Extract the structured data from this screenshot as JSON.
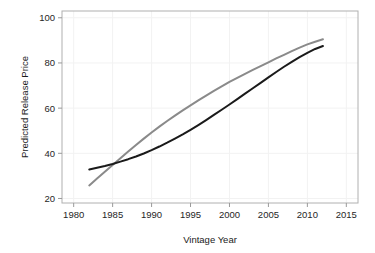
{
  "chart_data": {
    "type": "line",
    "title": "",
    "subtitle": "",
    "xlabel": "Vintage Year",
    "ylabel": "Predicted Release Price",
    "xlim": [
      1978.5,
      2016.5
    ],
    "ylim": [
      18.0,
      103.0
    ],
    "xticks": [
      1980,
      1985,
      1990,
      1995,
      2000,
      2005,
      2010,
      2015
    ],
    "xtick_labels": [
      "1980",
      "1985",
      "1990",
      "1995",
      "2000",
      "2005",
      "2010",
      "2015"
    ],
    "yticks": [
      20,
      40,
      60,
      80,
      100
    ],
    "ytick_labels": [
      "20",
      "40",
      "60",
      "80",
      "100"
    ],
    "grid": "faint",
    "legend": "none",
    "series": [
      {
        "name": "gray-curve",
        "color": "#8a8a8a",
        "linewidth": 2.0,
        "x": [
          1982,
          1983,
          1984,
          1985,
          1986,
          1987,
          1988,
          1989,
          1990,
          1991,
          1992,
          1993,
          1994,
          1995,
          1996,
          1997,
          1998,
          1999,
          2000,
          2001,
          2002,
          2003,
          2004,
          2005,
          2006,
          2007,
          2008,
          2009,
          2010,
          2011,
          2012
        ],
        "values": [
          25.8,
          28.8,
          31.8,
          34.8,
          37.8,
          40.8,
          43.7,
          46.5,
          49.2,
          51.8,
          54.3,
          56.7,
          59.0,
          61.2,
          63.4,
          65.5,
          67.6,
          69.6,
          71.6,
          73.4,
          75.2,
          76.9,
          78.6,
          80.3,
          82.0,
          83.6,
          85.2,
          86.8,
          88.2,
          89.4,
          90.5
        ]
      },
      {
        "name": "black-curve",
        "color": "#1a1a1a",
        "linewidth": 2.0,
        "x": [
          1982,
          1983,
          1984,
          1985,
          1986,
          1987,
          1988,
          1989,
          1990,
          1991,
          1992,
          1993,
          1994,
          1995,
          1996,
          1997,
          1998,
          1999,
          2000,
          2001,
          2002,
          2003,
          2004,
          2005,
          2006,
          2007,
          2008,
          2009,
          2010,
          2011,
          2012
        ],
        "values": [
          32.8,
          33.6,
          34.4,
          35.3,
          36.3,
          37.4,
          38.6,
          39.9,
          41.4,
          43.0,
          44.7,
          46.5,
          48.4,
          50.4,
          52.5,
          54.7,
          57.0,
          59.3,
          61.6,
          64.0,
          66.4,
          68.8,
          71.2,
          73.6,
          76.0,
          78.3,
          80.5,
          82.6,
          84.5,
          86.2,
          87.5
        ]
      }
    ]
  },
  "plot_frame": {
    "border_color": "#b0b0b0",
    "background_color": "#ffffff",
    "gridline_color": "#f2f2f2"
  }
}
